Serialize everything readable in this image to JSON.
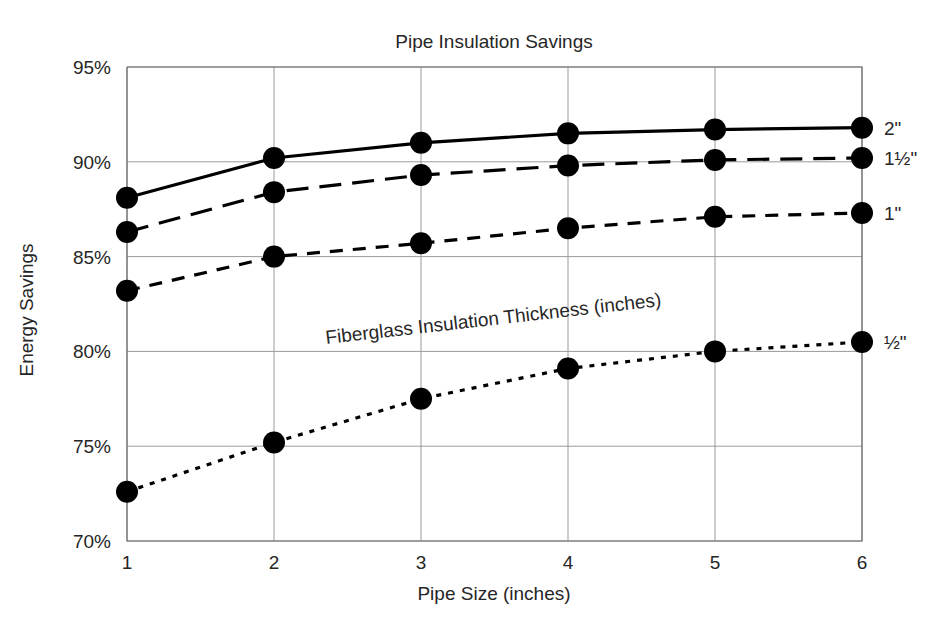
{
  "chart_data": {
    "type": "line",
    "title": "Pipe Insulation Savings",
    "xlabel": "Pipe Size (inches)",
    "ylabel": "Energy Savings",
    "annotation": "Fiberglass Insulation Thickness (inches)",
    "x": [
      1,
      2,
      3,
      4,
      5,
      6
    ],
    "xtick_labels": [
      "1",
      "2",
      "3",
      "4",
      "5",
      "6"
    ],
    "ytick_labels": [
      "70%",
      "75%",
      "80%",
      "85%",
      "90%",
      "95%"
    ],
    "ytick_values": [
      70,
      75,
      80,
      85,
      90,
      95
    ],
    "ylim": [
      70,
      95
    ],
    "xlim": [
      1,
      6
    ],
    "grid": true,
    "legend_position": "right-of-plot-endpoints",
    "series": [
      {
        "name": "2\"",
        "label": "2\"",
        "linestyle": "solid",
        "color": "#000000",
        "values": [
          88.1,
          90.2,
          91.0,
          91.5,
          91.7,
          91.8
        ]
      },
      {
        "name": "1½\"",
        "label": "1½\"",
        "linestyle": "long-dash",
        "color": "#000000",
        "values": [
          86.3,
          88.4,
          89.3,
          89.8,
          90.1,
          90.2
        ]
      },
      {
        "name": "1\"",
        "label": "1\"",
        "linestyle": "medium-dash",
        "color": "#000000",
        "values": [
          83.2,
          85.0,
          85.7,
          86.5,
          87.1,
          87.3
        ]
      },
      {
        "name": "½\"",
        "label": "½\"",
        "linestyle": "dotted",
        "color": "#000000",
        "values": [
          72.6,
          75.2,
          77.5,
          79.1,
          80.0,
          80.5
        ]
      }
    ]
  },
  "colors": {
    "ink": "#000000",
    "grid": "#9a9a9a",
    "frame": "#6e6e6e",
    "background": "#ffffff"
  }
}
